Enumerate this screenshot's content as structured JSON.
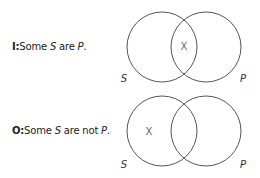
{
  "diagrams": [
    {
      "id": "I",
      "prefix": "I:",
      "text_a": "Some ",
      "var_s": "S",
      "text_b": " are ",
      "var_p": "P",
      "text_c": ".",
      "left_label": "S",
      "right_label": "P",
      "mark": "X",
      "mark_region": "intersection"
    },
    {
      "id": "O",
      "prefix": "O:",
      "text_a": "Some ",
      "var_s": "S",
      "text_b": " are not ",
      "var_p": "P",
      "text_c": ".",
      "left_label": "S",
      "right_label": "P",
      "mark": "X",
      "mark_region": "S-only"
    }
  ],
  "colors": {
    "stroke": "#555555",
    "text": "#222222",
    "mark": "#666666"
  }
}
